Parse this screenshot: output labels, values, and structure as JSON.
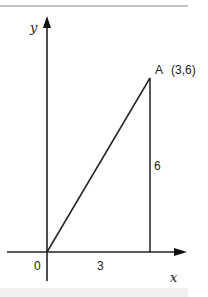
{
  "diagram": {
    "y_label": "y",
    "x_label": "x",
    "origin_label": "0",
    "point_label": "A",
    "point_coords": "(3,6)",
    "base_label": "3",
    "height_label": "6"
  }
}
